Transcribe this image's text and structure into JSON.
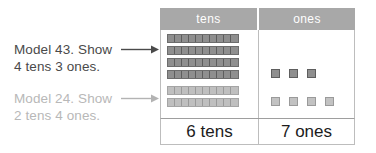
{
  "worksheet": {
    "instructions": [
      {
        "id": "instruction-1",
        "text": "Model 43. Show\n4 tens 3 ones.",
        "color": "#4a4a4a",
        "model_number": 43,
        "tens": 4,
        "ones": 3
      },
      {
        "id": "instruction-2",
        "text": "Model 24. Show\n2 tens 4 ones.",
        "color": "#b8b8b8",
        "model_number": 24,
        "tens": 2,
        "ones": 4
      }
    ],
    "table": {
      "headers": {
        "tens": "tens",
        "ones": "ones"
      },
      "header_background": "#a8a8a8",
      "header_text_color": "#ffffff",
      "totals": {
        "tens": "6 tens",
        "ones": "7 ones"
      }
    },
    "blocks": {
      "units_per_rod": 10,
      "tens_rods": [
        {
          "shade": "dark",
          "units": 10
        },
        {
          "shade": "dark",
          "units": 10
        },
        {
          "shade": "dark",
          "units": 10
        },
        {
          "shade": "dark",
          "units": 10
        },
        {
          "shade": "light",
          "units": 10
        },
        {
          "shade": "light",
          "units": 10
        }
      ],
      "ones_rows": [
        {
          "shade": "dark",
          "count": 3
        },
        {
          "shade": "light",
          "count": 4
        }
      ]
    }
  }
}
